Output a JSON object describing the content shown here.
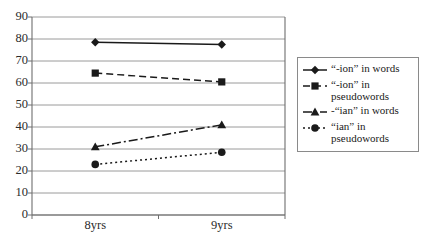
{
  "chart_data": {
    "type": "line",
    "title": "",
    "xlabel": "",
    "ylabel": "",
    "categories": [
      "8yrs",
      "9yrs"
    ],
    "ylim": [
      0,
      90
    ],
    "ytick_step": 10,
    "yticks": [
      90,
      80,
      70,
      60,
      50,
      40,
      30,
      20,
      10,
      0
    ],
    "grid": true,
    "legend_position": "right",
    "series": [
      {
        "name": "“-ion” in words",
        "values": [
          78.5,
          77.5
        ],
        "marker": "diamond",
        "linestyle": "solid",
        "color": "#1a1a1a"
      },
      {
        "name": "“-ion” in\npseudowords",
        "values": [
          64.5,
          60.5
        ],
        "marker": "square",
        "linestyle": "dashed",
        "color": "#1a1a1a"
      },
      {
        "name": "-“ian” in words",
        "values": [
          31,
          41
        ],
        "marker": "triangle",
        "linestyle": "dashdot",
        "color": "#1a1a1a"
      },
      {
        "name": "“ian” in\npseudowords",
        "values": [
          23,
          28.5
        ],
        "marker": "circle",
        "linestyle": "dotted",
        "color": "#1a1a1a"
      }
    ]
  },
  "axis": {
    "y_labels": [
      "90",
      "80",
      "70",
      "60",
      "50",
      "40",
      "30",
      "20",
      "10",
      "0"
    ],
    "x_labels": [
      "8yrs",
      "9yrs"
    ]
  },
  "legend": {
    "entries": [
      {
        "label": "“-ion” in words",
        "marker": "diamond",
        "linestyle": "solid"
      },
      {
        "label": "“-ion” in\npseudowords",
        "marker": "square",
        "linestyle": "dashed"
      },
      {
        "label": "-“ian” in words",
        "marker": "triangle",
        "linestyle": "dashdot"
      },
      {
        "label": "“ian” in\npseudowords",
        "marker": "circle",
        "linestyle": "dotted"
      }
    ]
  },
  "colors": {
    "ink": "#1a1a1a",
    "grid": "#8f8f8f",
    "axis": "#6e6e6e",
    "legend_border": "#8a8a8a",
    "background": "#ffffff"
  }
}
